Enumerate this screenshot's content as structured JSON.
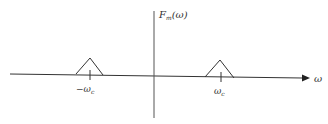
{
  "diagram": {
    "type": "frequency-spectrum",
    "y_axis_label": {
      "main": "F",
      "sub": "m",
      "arg": "(ω)"
    },
    "x_axis_label": "ω",
    "ticks": [
      {
        "label_prefix": "−",
        "label_main": "ω",
        "label_sub": "c",
        "position": "negative"
      },
      {
        "label_prefix": "",
        "label_main": "ω",
        "label_sub": "c",
        "position": "positive"
      }
    ],
    "spectra": [
      {
        "shape": "triangle",
        "center": "-ωc"
      },
      {
        "shape": "triangle",
        "center": "ωc"
      }
    ],
    "colors": {
      "line": "#333333",
      "background": "#ffffff"
    }
  }
}
